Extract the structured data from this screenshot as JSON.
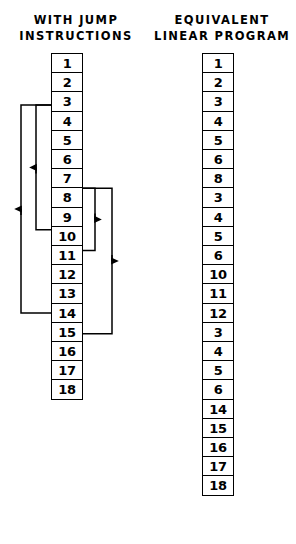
{
  "headers": {
    "left": "WITH JUMP\nINSTRUCTIONS",
    "right": "EQUIVALENT\nLINEAR PROGRAM"
  },
  "jump_column": {
    "label": "with-jump-instructions",
    "cells": [
      "1",
      "2",
      "3",
      "4",
      "5",
      "6",
      "7",
      "8",
      "9",
      "10",
      "11",
      "12",
      "13",
      "14",
      "15",
      "16",
      "17",
      "18"
    ]
  },
  "linear_column": {
    "label": "equivalent-linear-program",
    "cells": [
      "1",
      "2",
      "3",
      "4",
      "5",
      "6",
      "8",
      "3",
      "4",
      "5",
      "6",
      "10",
      "11",
      "12",
      "3",
      "4",
      "5",
      "6",
      "14",
      "15",
      "16",
      "17",
      "18"
    ]
  },
  "jumps": [
    {
      "name": "jump-9-to-3",
      "from": "9",
      "to": "3",
      "direction": "up",
      "side": "left",
      "track": 36
    },
    {
      "name": "jump-13-to-3",
      "from": "13",
      "to": "3",
      "direction": "up",
      "side": "left",
      "track": 21
    },
    {
      "name": "jump-7-to-10",
      "from": "7",
      "to": "10",
      "direction": "down",
      "side": "right",
      "track": 95
    },
    {
      "name": "jump-7-to-14",
      "from": "7",
      "to": "14",
      "direction": "down",
      "side": "right",
      "track": 112
    }
  ],
  "style": {
    "line_color": "#000000",
    "box_border": "#000000",
    "background": "#ffffff"
  }
}
